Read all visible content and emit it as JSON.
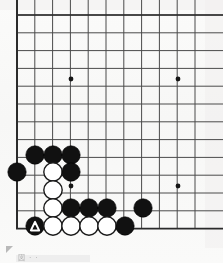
{
  "diagram": {
    "type": "go-board-problem-diagram",
    "board": {
      "visible_columns": 11,
      "visible_rows": 13,
      "line_color": "#4a4a4a",
      "edge_color": "#2b2b2b",
      "background_color": "#fbfbfa",
      "origin_x": 17,
      "origin_y": 15,
      "spacing": 17.8,
      "star_points": [
        {
          "col": 3,
          "row": 3.6,
          "x": 71,
          "y": 79
        },
        {
          "col": 9,
          "row": 3.6,
          "x": 178,
          "y": 79
        },
        {
          "col": 3,
          "row": 9.6,
          "x": 71,
          "y": 186
        },
        {
          "col": 9,
          "row": 9.6,
          "x": 178,
          "y": 186
        }
      ],
      "star_point_radius": 2.4,
      "stone_radius": 9.2
    },
    "stones": [
      {
        "id": "b1",
        "color": "black",
        "x": 35,
        "y": 155,
        "mark": "none"
      },
      {
        "id": "b2",
        "color": "black",
        "x": 53,
        "y": 155,
        "mark": "none"
      },
      {
        "id": "b3",
        "color": "black",
        "x": 71,
        "y": 155,
        "mark": "none"
      },
      {
        "id": "b4",
        "color": "black",
        "x": 17,
        "y": 172,
        "mark": "none"
      },
      {
        "id": "w1",
        "color": "white",
        "x": 53,
        "y": 172,
        "mark": "none"
      },
      {
        "id": "b5",
        "color": "black",
        "x": 71,
        "y": 172,
        "mark": "none"
      },
      {
        "id": "w2",
        "color": "white",
        "x": 53,
        "y": 190,
        "mark": "none"
      },
      {
        "id": "w3",
        "color": "white",
        "x": 53,
        "y": 208,
        "mark": "none"
      },
      {
        "id": "b6",
        "color": "black",
        "x": 71,
        "y": 208,
        "mark": "none"
      },
      {
        "id": "b7",
        "color": "black",
        "x": 89,
        "y": 208,
        "mark": "none"
      },
      {
        "id": "b8",
        "color": "black",
        "x": 107,
        "y": 208,
        "mark": "none"
      },
      {
        "id": "b9",
        "color": "black",
        "x": 143,
        "y": 208,
        "mark": "none"
      },
      {
        "id": "bT",
        "color": "black",
        "x": 35,
        "y": 226,
        "mark": "triangle"
      },
      {
        "id": "w4",
        "color": "white",
        "x": 53,
        "y": 226,
        "mark": "none"
      },
      {
        "id": "w5",
        "color": "white",
        "x": 71,
        "y": 226,
        "mark": "none"
      },
      {
        "id": "w6",
        "color": "white",
        "x": 89,
        "y": 226,
        "mark": "none"
      },
      {
        "id": "w7",
        "color": "white",
        "x": 107,
        "y": 226,
        "mark": "none"
      },
      {
        "id": "b10",
        "color": "black",
        "x": 125,
        "y": 226,
        "mark": "none"
      }
    ],
    "colors": {
      "black_stone": "#111111",
      "white_stone": "#ffffff",
      "white_stone_border": "#1a1a1a",
      "triangle_mark": "#ffffff",
      "grid": "#4a4a4a"
    }
  },
  "caption": {
    "text": "図 · ·",
    "visible": true
  }
}
